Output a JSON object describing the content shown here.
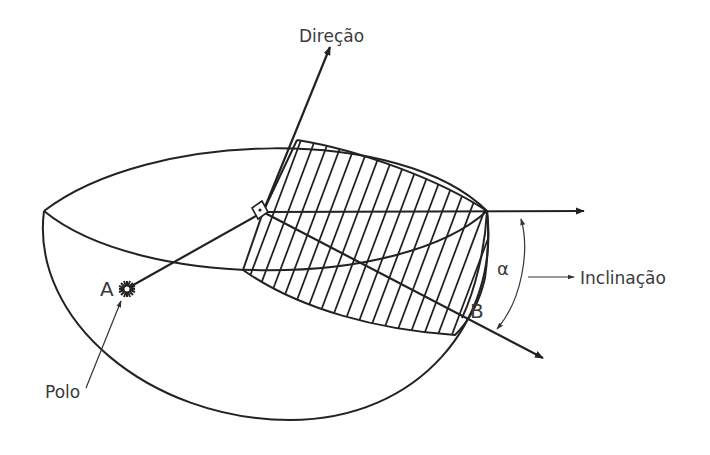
{
  "diagram": {
    "labels": {
      "direction": "Direção",
      "inclination": "Inclinação",
      "pole": "Polo",
      "point_a": "A",
      "point_b": "B",
      "alpha": "α"
    },
    "colors": {
      "stroke": "#222222",
      "text": "#3a3a3a",
      "background": "#ffffff"
    }
  }
}
